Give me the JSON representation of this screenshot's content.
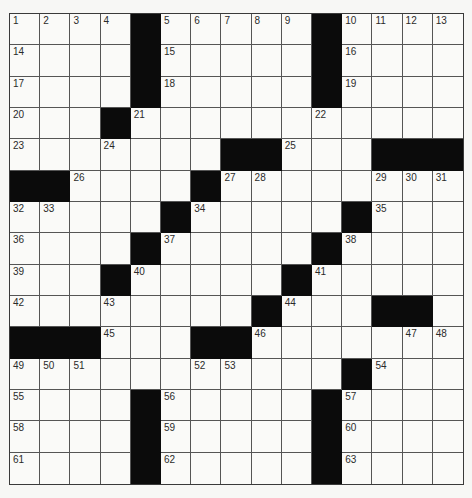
{
  "puzzle": {
    "size": {
      "rows": 15,
      "cols": 15
    },
    "colors": {
      "background": "#f7f7f5",
      "cell": "#fafaf8",
      "block": "#0b0b0b",
      "grid_line": "#555555",
      "number": "#2a2a2a"
    },
    "layout": [
      "....#.....#....",
      "....#.....#....",
      "....#.....#....",
      "...#...........",
      ".......##...###",
      "##....#........",
      ".....#.....#...",
      "....#.....#....",
      "...#.....#.....",
      "........#...##.",
      "###...##.......",
      "...........#...",
      "....#.....#....",
      "....#.....#....",
      "....#.....#...."
    ],
    "numbers": [
      [
        1,
        2,
        3,
        4,
        0,
        5,
        6,
        7,
        8,
        9,
        0,
        10,
        11,
        12,
        13
      ],
      [
        14,
        0,
        0,
        0,
        0,
        15,
        0,
        0,
        0,
        0,
        0,
        16,
        0,
        0,
        0
      ],
      [
        17,
        0,
        0,
        0,
        0,
        18,
        0,
        0,
        0,
        0,
        0,
        19,
        0,
        0,
        0
      ],
      [
        20,
        0,
        0,
        0,
        21,
        0,
        0,
        0,
        0,
        0,
        22,
        0,
        0,
        0,
        0
      ],
      [
        23,
        0,
        0,
        24,
        0,
        0,
        0,
        0,
        0,
        25,
        0,
        0,
        0,
        0,
        0
      ],
      [
        0,
        0,
        26,
        0,
        0,
        0,
        0,
        27,
        28,
        0,
        0,
        0,
        29,
        30,
        31
      ],
      [
        32,
        33,
        0,
        0,
        0,
        0,
        34,
        0,
        0,
        0,
        0,
        0,
        35,
        0,
        0
      ],
      [
        36,
        0,
        0,
        0,
        0,
        37,
        0,
        0,
        0,
        0,
        0,
        38,
        0,
        0,
        0
      ],
      [
        39,
        0,
        0,
        0,
        40,
        0,
        0,
        0,
        0,
        0,
        41,
        0,
        0,
        0,
        0
      ],
      [
        42,
        0,
        0,
        43,
        0,
        0,
        0,
        0,
        0,
        44,
        0,
        0,
        0,
        0,
        0
      ],
      [
        0,
        0,
        0,
        45,
        0,
        0,
        0,
        0,
        46,
        0,
        0,
        0,
        0,
        47,
        48
      ],
      [
        49,
        50,
        51,
        0,
        0,
        0,
        52,
        53,
        0,
        0,
        0,
        0,
        54,
        0,
        0
      ],
      [
        55,
        0,
        0,
        0,
        0,
        56,
        0,
        0,
        0,
        0,
        0,
        57,
        0,
        0,
        0
      ],
      [
        58,
        0,
        0,
        0,
        0,
        59,
        0,
        0,
        0,
        0,
        0,
        60,
        0,
        0,
        0
      ],
      [
        61,
        0,
        0,
        0,
        0,
        62,
        0,
        0,
        0,
        0,
        0,
        63,
        0,
        0,
        0
      ]
    ]
  }
}
